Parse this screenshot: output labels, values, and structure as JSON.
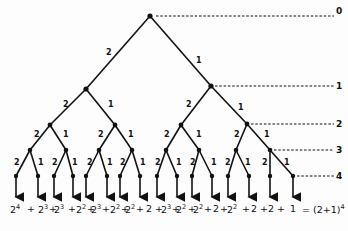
{
  "diagram": {
    "type": "binary-tree",
    "edge_labels": {
      "left": "2",
      "right": "1"
    },
    "levels": [
      {
        "label": "0",
        "y": 16
      },
      {
        "label": "1",
        "y": 86
      },
      {
        "label": "2",
        "y": 124
      },
      {
        "label": "3",
        "y": 150
      },
      {
        "label": "4",
        "y": 175
      }
    ],
    "formula_terms": [
      "2^4",
      "+",
      "2^3",
      "+",
      "2^3",
      "+",
      "2^2",
      "+",
      "2^3",
      "+",
      "2^2",
      "+",
      "2^2",
      "+",
      "2",
      "+",
      "2^3",
      "+",
      "2^2",
      "+",
      "2^2",
      "+",
      "2",
      "+",
      "2^2",
      "+",
      "2",
      "+",
      "2",
      "+",
      "1"
    ],
    "formula_result": "= (2+1)^4"
  }
}
